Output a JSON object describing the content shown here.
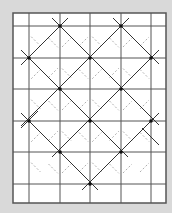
{
  "diagram": {
    "background": "#d9d9d9",
    "paper_color": "#ffffff",
    "line_color": "#333333",
    "grid_line_color": "#555555",
    "arrow_color": "#9a9a9a",
    "frame": {
      "x": 13,
      "y": 13,
      "w": 153,
      "h": 190
    },
    "grid_x": [
      29,
      60,
      90,
      121,
      151
    ],
    "grid_y": [
      26,
      58,
      89,
      121,
      152,
      184
    ],
    "nodes": [
      [
        60,
        26
      ],
      [
        121,
        26
      ],
      [
        29,
        58
      ],
      [
        90,
        58
      ],
      [
        151,
        58
      ],
      [
        60,
        89
      ],
      [
        121,
        89
      ],
      [
        29,
        121
      ],
      [
        90,
        121
      ],
      [
        151,
        121
      ],
      [
        60,
        152
      ],
      [
        121,
        152
      ],
      [
        90,
        184
      ]
    ],
    "diagonals": [
      [
        [
          52,
          18
        ],
        [
          159,
          125
        ]
      ],
      [
        [
          113,
          18
        ],
        [
          159,
          64
        ]
      ],
      [
        [
          21,
          50
        ],
        [
          128,
          157
        ]
      ],
      [
        [
          21,
          113
        ],
        [
          98,
          190
        ]
      ],
      [
        [
          68,
          18
        ],
        [
          21,
          65
        ]
      ],
      [
        [
          129,
          18
        ],
        [
          21,
          126
        ]
      ],
      [
        [
          159,
          50
        ],
        [
          52,
          157
        ]
      ],
      [
        [
          159,
          113
        ],
        [
          82,
          190
        ]
      ],
      [
        [
          21,
          128
        ],
        [
          38,
          111
        ]
      ],
      [
        [
          142,
          128
        ],
        [
          159,
          145
        ]
      ]
    ]
  }
}
